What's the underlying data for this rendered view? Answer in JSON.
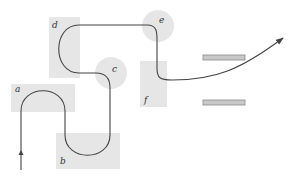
{
  "diagram": {
    "colors": {
      "background": "#ffffff",
      "region_fill": "#e6e6e6",
      "path_stroke": "#444444",
      "bar_fill": "#c8c8c8",
      "bar_stroke": "#8a8a8a",
      "label": "#333333"
    },
    "regions": [
      {
        "id": "a",
        "label": "a",
        "shape": "rect"
      },
      {
        "id": "b",
        "label": "b",
        "shape": "rect"
      },
      {
        "id": "c",
        "label": "c",
        "shape": "circle"
      },
      {
        "id": "d",
        "label": "d",
        "shape": "rect"
      },
      {
        "id": "e",
        "label": "e",
        "shape": "circle"
      },
      {
        "id": "f",
        "label": "f",
        "shape": "rect"
      }
    ],
    "bars": [
      {
        "id": "upper-bar"
      },
      {
        "id": "lower-bar"
      }
    ],
    "path": {
      "start": "bottom-left with upward arrow",
      "end": "arrowhead pointing up-right between/beyond bars"
    }
  }
}
